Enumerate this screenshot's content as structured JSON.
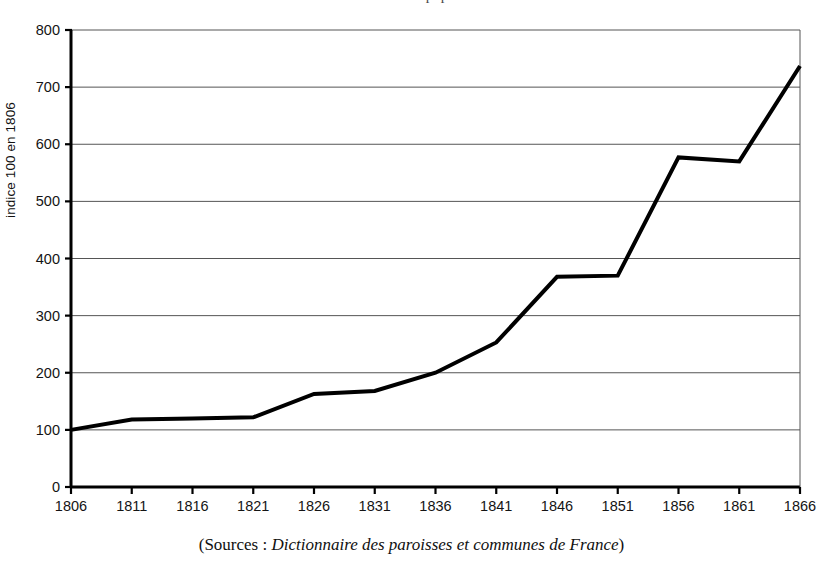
{
  "figure": {
    "title_partial": "évolution de la population",
    "ylabel": "indice 100 en 1806",
    "caption_prefix": "(Sources :",
    "caption_italic": "Dictionnaire des paroisses et communes de France",
    "caption_suffix": ")"
  },
  "chart_data": {
    "type": "line",
    "title": "évolution de la population",
    "xlabel": "",
    "ylabel": "indice 100 en 1806",
    "categories": [
      "1806",
      "1811",
      "1816",
      "1821",
      "1826",
      "1831",
      "1836",
      "1841",
      "1846",
      "1851",
      "1856",
      "1861",
      "1866"
    ],
    "x": [
      1806,
      1811,
      1816,
      1821,
      1826,
      1831,
      1836,
      1841,
      1846,
      1851,
      1856,
      1861,
      1866
    ],
    "values": [
      100,
      118,
      120,
      122,
      163,
      168,
      200,
      253,
      368,
      370,
      577,
      570,
      737
    ],
    "xlim": [
      1806,
      1866
    ],
    "ylim": [
      0,
      800
    ],
    "yticks": [
      0,
      100,
      200,
      300,
      400,
      500,
      600,
      700,
      800
    ],
    "xticks": [
      1806,
      1811,
      1816,
      1821,
      1826,
      1831,
      1836,
      1841,
      1846,
      1851,
      1856,
      1861,
      1866
    ],
    "ytick_labels": [
      "0",
      "100",
      "200",
      "300",
      "400",
      "500",
      "600",
      "700",
      "800"
    ],
    "xtick_labels": [
      "1806",
      "1811",
      "1816",
      "1821",
      "1826",
      "1831",
      "1836",
      "1841",
      "1846",
      "1851",
      "1856",
      "1861",
      "1866"
    ],
    "grid": "horizontal",
    "legend": null,
    "line_color": "#000000",
    "line_width": 4,
    "series": [
      {
        "name": "indice population",
        "values": [
          100,
          118,
          120,
          122,
          163,
          168,
          200,
          253,
          368,
          370,
          577,
          570,
          737
        ]
      }
    ]
  },
  "axes": {
    "ytick_labels": [
      "800",
      "700",
      "600",
      "500",
      "400",
      "300",
      "200",
      "100",
      "0"
    ],
    "xtick_labels": [
      "1806",
      "1811",
      "1816",
      "1821",
      "1826",
      "1831",
      "1836",
      "1841",
      "1846",
      "1851",
      "1856",
      "1861",
      "1866"
    ]
  },
  "colors": {
    "line": "#000000",
    "grid": "#555555",
    "axis": "#000000",
    "background": "#ffffff"
  }
}
